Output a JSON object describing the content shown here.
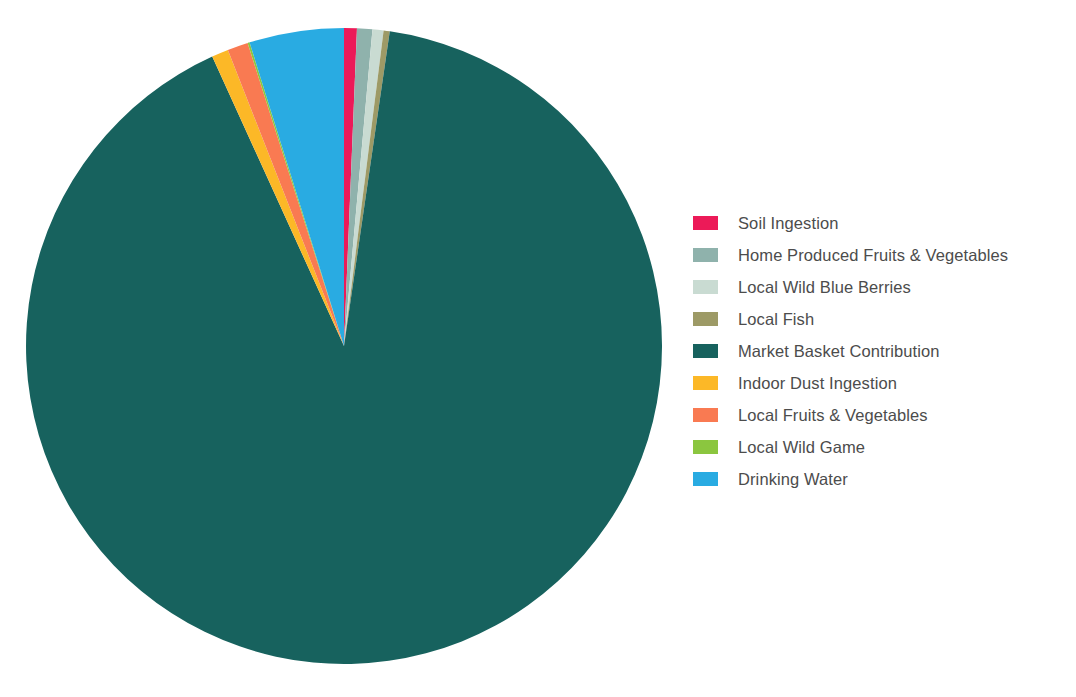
{
  "chart_data": {
    "type": "pie",
    "title": "",
    "subtitle": "",
    "xlabel": "",
    "ylabel": "",
    "grid": false,
    "legend_position": "right",
    "center": {
      "x": 344,
      "y": 346
    },
    "radius": 318,
    "start_angle_deg": 0,
    "direction": "clockwise",
    "categories": [
      "Soil Ingestion",
      "Home Produced Fruits & Vegetables",
      "Local Wild Blue Berries",
      "Local Fish",
      "Market Basket Contribution",
      "Indoor Dust Ingestion",
      "Local Fruits & Vegetables",
      "Local Wild Game",
      "Drinking Water"
    ],
    "values": [
      0.65,
      0.78,
      0.56,
      0.31,
      90.9,
      0.85,
      1.05,
      0.1,
      4.8
    ],
    "units": "percent",
    "colors": [
      "#ec1a58",
      "#8fb2ac",
      "#c9dbd2",
      "#9d9a66",
      "#17625e",
      "#fcb827",
      "#f97a52",
      "#8bc63f",
      "#29abe2"
    ],
    "slices": [
      {
        "label": "Soil Ingestion",
        "value": 0.65,
        "color": "#ec1a58",
        "start_deg": 0.0,
        "end_deg": 2.34
      },
      {
        "label": "Home Produced Fruits & Vegetables",
        "value": 0.78,
        "color": "#8fb2ac",
        "start_deg": 2.34,
        "end_deg": 5.14
      },
      {
        "label": "Local Wild Blue Berries",
        "value": 0.56,
        "color": "#c9dbd2",
        "start_deg": 5.14,
        "end_deg": 7.16
      },
      {
        "label": "Local Fish",
        "value": 0.31,
        "color": "#9d9a66",
        "start_deg": 7.16,
        "end_deg": 8.28
      },
      {
        "label": "Market Basket Contribution",
        "value": 90.9,
        "color": "#17625e",
        "start_deg": 8.28,
        "end_deg": 335.52
      },
      {
        "label": "Indoor Dust Ingestion",
        "value": 0.85,
        "color": "#fcb827",
        "start_deg": 335.52,
        "end_deg": 338.58
      },
      {
        "label": "Local Fruits & Vegetables",
        "value": 1.05,
        "color": "#f97a52",
        "start_deg": 338.58,
        "end_deg": 342.36
      },
      {
        "label": "Local Wild Game",
        "value": 0.1,
        "color": "#8bc63f",
        "start_deg": 342.36,
        "end_deg": 342.72
      },
      {
        "label": "Drinking Water",
        "value": 4.8,
        "color": "#29abe2",
        "start_deg": 342.72,
        "end_deg": 360.0
      }
    ]
  },
  "legend": {
    "items": [
      {
        "label": "Soil Ingestion",
        "color": "#ec1a58",
        "icon": "legend-swatch-icon"
      },
      {
        "label": "Home Produced Fruits & Vegetables",
        "color": "#8fb2ac",
        "icon": "legend-swatch-icon"
      },
      {
        "label": "Local Wild Blue Berries",
        "color": "#c9dbd2",
        "icon": "legend-swatch-icon"
      },
      {
        "label": "Local Fish",
        "color": "#9d9a66",
        "icon": "legend-swatch-icon"
      },
      {
        "label": "Market Basket Contribution",
        "color": "#17625e",
        "icon": "legend-swatch-icon"
      },
      {
        "label": "Indoor Dust Ingestion",
        "color": "#fcb827",
        "icon": "legend-swatch-icon"
      },
      {
        "label": "Local Fruits & Vegetables",
        "color": "#f97a52",
        "icon": "legend-swatch-icon"
      },
      {
        "label": "Local Wild Game",
        "color": "#8bc63f",
        "icon": "legend-swatch-icon"
      },
      {
        "label": "Drinking Water",
        "color": "#29abe2",
        "icon": "legend-swatch-icon"
      }
    ]
  },
  "theme": {
    "background": "#ffffff",
    "text_color": "#4c4c4c"
  }
}
